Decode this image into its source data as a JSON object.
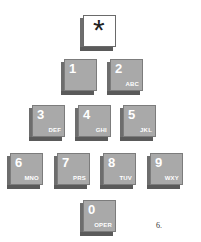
{
  "keypad": {
    "keys": [
      {
        "id": "star",
        "digit": "*",
        "letters": "",
        "x": 80,
        "y": 15
      },
      {
        "id": "1",
        "digit": "1",
        "letters": "",
        "x": 61,
        "y": 59
      },
      {
        "id": "2",
        "digit": "2",
        "letters": "ABC",
        "x": 107,
        "y": 59
      },
      {
        "id": "3",
        "digit": "3",
        "letters": "DEF",
        "x": 29,
        "y": 105
      },
      {
        "id": "4",
        "digit": "4",
        "letters": "GHI",
        "x": 75,
        "y": 105
      },
      {
        "id": "5",
        "digit": "5",
        "letters": "JKL",
        "x": 120,
        "y": 105
      },
      {
        "id": "6",
        "digit": "6",
        "letters": "MNO",
        "x": 7,
        "y": 153
      },
      {
        "id": "7",
        "digit": "7",
        "letters": "PRS",
        "x": 54,
        "y": 153
      },
      {
        "id": "8",
        "digit": "8",
        "letters": "TUV",
        "x": 100,
        "y": 153
      },
      {
        "id": "9",
        "digit": "9",
        "letters": "WXY",
        "x": 147,
        "y": 153
      },
      {
        "id": "0",
        "digit": "0",
        "letters": "OPER",
        "x": 80,
        "y": 200
      }
    ],
    "colors": {
      "key_face": "#a9a9a9",
      "key_side": "#6d6d6d",
      "star_face": "#ffffff",
      "label": "#ffffff"
    }
  },
  "caption": "6."
}
